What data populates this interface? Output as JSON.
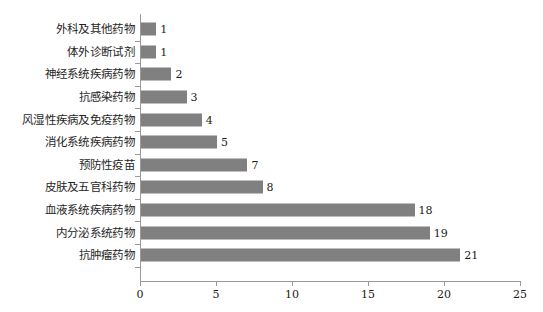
{
  "chart_data": {
    "type": "bar",
    "orientation": "horizontal",
    "title": "",
    "subtitle": "",
    "xlabel": "",
    "ylabel": "",
    "categories": [
      "外科及其他药物",
      "体外诊断试剂",
      "神经系统疾病药物",
      "抗感染药物",
      "风湿性疾病及免疫药物",
      "消化系统疾病药物",
      "预防性疫苗",
      "皮肤及五官科药物",
      "血液系统疾病药物",
      "内分泌系统药物",
      "抗肿瘤药物"
    ],
    "values": [
      1,
      1,
      2,
      3,
      4,
      5,
      7,
      8,
      18,
      19,
      21
    ],
    "data_labels": [
      "1",
      "1",
      "2",
      "3",
      "4",
      "5",
      "7",
      "8",
      "18",
      "19",
      "21"
    ],
    "xlim": [
      0,
      25
    ],
    "xticks": [
      0,
      5,
      10,
      15,
      20,
      25
    ],
    "xtick_labels": [
      "0",
      "5",
      "10",
      "15",
      "20",
      "25"
    ],
    "grid": false,
    "legend": false,
    "bar_color": "#808080",
    "axis_color": "#9a9a9a",
    "background_color": "#ffffff",
    "text_color": "#1a1a1a"
  }
}
